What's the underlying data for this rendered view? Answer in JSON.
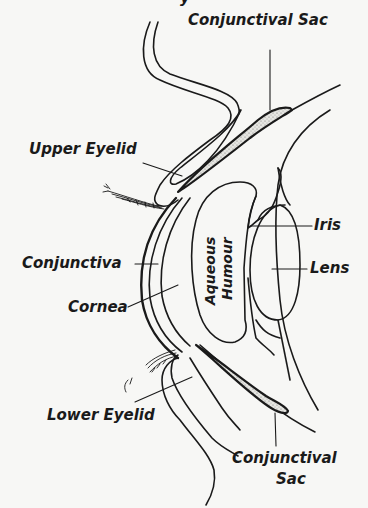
{
  "figure": {
    "top_cut_text": "y",
    "background": "#f7f7f5",
    "ink": "#1a1a1a"
  },
  "labels": {
    "conjunctival_sac_top": "Conjunctival Sac",
    "upper_eyelid": "Upper Eyelid",
    "iris": "Iris",
    "lens": "Lens",
    "conjunctiva": "Conjunctiva",
    "cornea": "Cornea",
    "aqueous": "Aqueous",
    "humour": "Humour",
    "lower_eyelid": "Lower Eyelid",
    "conjunctival_sac_bottom_1": "Conjunctival",
    "conjunctival_sac_bottom_2": "Sac"
  }
}
